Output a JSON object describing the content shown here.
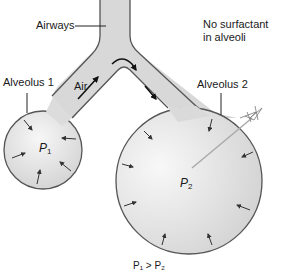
{
  "diagram": {
    "labels": {
      "airways": "Airways",
      "air": "Air",
      "alveolus1": "Alveolus 1",
      "alveolus2": "Alveolus 2",
      "note_line1": "No surfactant",
      "note_line2": "in alveoli",
      "p1_main": "P",
      "p1_sub": "1",
      "p2_main": "P",
      "p2_sub": "2",
      "bottom_partial": "P₁ > P₂"
    },
    "colors": {
      "fill": "#d6d6d6",
      "stroke": "#555555",
      "arrow": "#333333",
      "text": "#1a1a1a"
    },
    "alveolus1": {
      "cx": 43,
      "cy": 150,
      "r": 39
    },
    "alveolus2": {
      "cx": 189,
      "cy": 181,
      "r": 73
    }
  }
}
